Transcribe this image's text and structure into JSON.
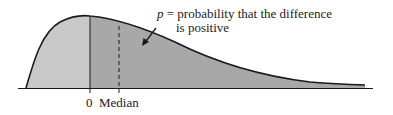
{
  "diagram": {
    "type": "skewed-distribution",
    "annotation": {
      "variable": "p",
      "equals": "=",
      "line1": "probability that the difference",
      "line2": "is positive"
    },
    "axis_labels": {
      "zero": "0",
      "median": "Median"
    },
    "colors": {
      "left_fill": "#c9c9c9",
      "right_fill": "#a8a8a8",
      "stroke": "#1a1a1a"
    }
  }
}
